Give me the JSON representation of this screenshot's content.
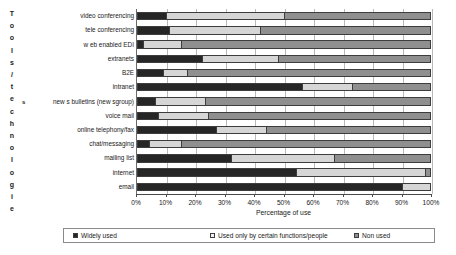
{
  "chart_data": {
    "type": "bar",
    "orientation": "horizontal",
    "stacked": true,
    "stack_mode": "percent",
    "title": "",
    "xlabel": "Percentage of use",
    "ylabel": "Tools/technologies",
    "xlim": [
      0,
      100
    ],
    "xticks": [
      "0%",
      "10%",
      "20%",
      "30%",
      "40%",
      "50%",
      "60%",
      "70%",
      "80%",
      "90%",
      "100%"
    ],
    "xtick_values": [
      0,
      10,
      20,
      30,
      40,
      50,
      60,
      70,
      80,
      90,
      100
    ],
    "grid": true,
    "grid_axis": "x",
    "legend_position": "bottom",
    "categories": [
      "video conferencing",
      "tele conferencing",
      "w eb enabled EDI",
      "extranets",
      "B2E",
      "intranet",
      "new s bulletins (new sgroup)",
      "voice mail",
      "online telephony/fax",
      "chat/messaging",
      "mailing list",
      "internet",
      "email"
    ],
    "series": [
      {
        "name": "Widely used",
        "color": "#262626",
        "values": [
          10,
          11,
          2,
          22,
          9,
          56,
          6,
          7,
          27,
          4,
          32,
          54,
          90
        ]
      },
      {
        "name": "Used only by certain functions/people",
        "color": "#d6d6d6",
        "values": [
          40,
          31,
          13,
          26,
          8,
          17,
          17,
          17,
          17,
          11,
          35,
          44,
          10
        ]
      },
      {
        "name": "Non used",
        "color": "#8f8f8f",
        "values": [
          50,
          58,
          85,
          52,
          83,
          27,
          77,
          76,
          56,
          85,
          33,
          2,
          0
        ]
      }
    ]
  },
  "y_axis_title_letters": [
    "T",
    "o",
    "o",
    "l",
    "s",
    "/",
    "t",
    "e",
    "c",
    "h",
    "n",
    "o",
    "l",
    "o",
    "g",
    "i",
    "e"
  ],
  "y_axis_title_stray": "s",
  "legend": {
    "items": [
      {
        "label": "Widely used",
        "color": "#262626"
      },
      {
        "label": "Used only by certain functions/people",
        "color": "#f2f2f2"
      },
      {
        "label": "Non used",
        "color": "#8f8f8f"
      }
    ]
  }
}
